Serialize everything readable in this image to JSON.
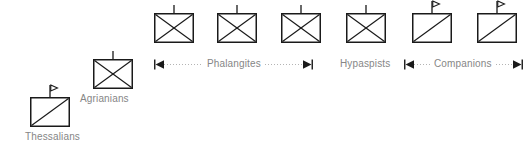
{
  "diagram": {
    "type": "military-unit-symbol-map",
    "background_color": "#ffffff",
    "line_color": "#1a1a1a",
    "label_color": "#868686",
    "symbol_box": {
      "width": 40,
      "height": 30
    },
    "units": [
      {
        "id": "thessalians",
        "label": "Thessalians",
        "symbol_kind": "cavalry",
        "glyph": "rectangle-with-diagonal",
        "topper": "flag",
        "box_x": 29,
        "box_y": 97,
        "label_x": 25,
        "label_y": 131
      },
      {
        "id": "agrianians",
        "label": "Agrianians",
        "symbol_kind": "infantry",
        "glyph": "rectangle-with-cross",
        "topper": "tick",
        "box_x": 92,
        "box_y": 59,
        "label_x": 80,
        "label_y": 93
      },
      {
        "id": "phalangites-1",
        "label": "",
        "symbol_kind": "infantry",
        "glyph": "rectangle-with-cross",
        "topper": "tick",
        "box_x": 153,
        "box_y": 13,
        "label_x": 0,
        "label_y": 0
      },
      {
        "id": "phalangites-2",
        "label": "",
        "symbol_kind": "infantry",
        "glyph": "rectangle-with-cross",
        "topper": "tick",
        "box_x": 216,
        "box_y": 13,
        "label_x": 0,
        "label_y": 0
      },
      {
        "id": "phalangites-3",
        "label": "",
        "symbol_kind": "infantry",
        "glyph": "rectangle-with-cross",
        "topper": "tick",
        "box_x": 280,
        "box_y": 13,
        "label_x": 0,
        "label_y": 0
      },
      {
        "id": "hypaspists-1",
        "label": "",
        "symbol_kind": "infantry",
        "glyph": "rectangle-with-cross",
        "topper": "tick",
        "box_x": 345,
        "box_y": 13,
        "label_x": 0,
        "label_y": 0
      },
      {
        "id": "companions-1",
        "label": "",
        "symbol_kind": "cavalry",
        "glyph": "rectangle-with-diagonal",
        "topper": "flag",
        "box_x": 411,
        "box_y": 13,
        "label_x": 0,
        "label_y": 0
      },
      {
        "id": "companions-2",
        "label": "",
        "symbol_kind": "cavalry",
        "glyph": "rectangle-with-diagonal",
        "topper": "flag",
        "box_x": 476,
        "box_y": 13,
        "label_x": 0,
        "label_y": 0
      }
    ],
    "formations": [
      {
        "id": "phalangites",
        "label": "Phalangites",
        "has_extent_line": true,
        "left_x": 154,
        "right_x": 313,
        "y": 58,
        "label_center_x": 234
      },
      {
        "id": "hypaspists",
        "label": "Hypaspists",
        "has_extent_line": false,
        "left_x": 0,
        "right_x": 0,
        "y": 58,
        "label_center_x": 365
      },
      {
        "id": "companions",
        "label": "Companions",
        "has_extent_line": true,
        "left_x": 404,
        "right_x": 523,
        "y": 58,
        "label_center_x": 463
      }
    ]
  }
}
